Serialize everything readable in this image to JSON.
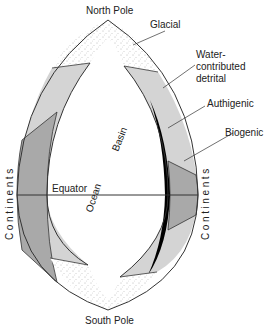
{
  "diagram": {
    "type": "schematic ocean basin sediment distribution",
    "labels": {
      "north_pole": "North Pole",
      "south_pole": "South Pole",
      "glacial": "Glacial",
      "water_detrital_1": "Water-",
      "water_detrital_2": "contributed",
      "water_detrital_3": "detrital",
      "authigenic": "Authigenic",
      "biogenic": "Biogenic",
      "equator": "Equator",
      "basin": "Basin",
      "ocean": "Ocean",
      "continents_left": "Continents",
      "continents_right": "Continents"
    },
    "colors": {
      "outline": "#333333",
      "detrital_fill": "#d4d4d4",
      "biogenic_fill": "#a9a9a9",
      "authigenic_fill": "#000000",
      "glacial_fill": "#f4f4f4",
      "background": "#ffffff"
    }
  }
}
